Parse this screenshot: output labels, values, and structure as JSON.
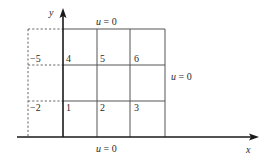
{
  "figure": {
    "axes": {
      "x_label": "x",
      "y_label": "y"
    },
    "boundary_labels": {
      "top": "u = 0",
      "bottom": "u = 0",
      "right": "u = 0"
    },
    "side_labels": {
      "upper": "−5",
      "lower": "−2"
    },
    "cells": [
      {
        "label": "1",
        "row": 0,
        "col": 0
      },
      {
        "label": "2",
        "row": 0,
        "col": 1
      },
      {
        "label": "3",
        "row": 0,
        "col": 2
      },
      {
        "label": "4",
        "row": 1,
        "col": 0
      },
      {
        "label": "5",
        "row": 1,
        "col": 1
      },
      {
        "label": "6",
        "row": 1,
        "col": 2
      }
    ],
    "grid": {
      "columns": 3,
      "rows": 3
    },
    "colors": {
      "line": "#555555",
      "axis": "#1a1a1a",
      "text": "#2a2a2a",
      "background": "#ffffff"
    }
  }
}
